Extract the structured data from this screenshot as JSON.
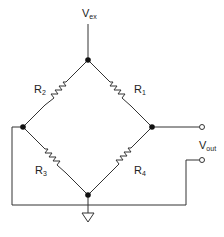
{
  "diagram": {
    "labels": {
      "vex_main": "V",
      "vex_sub": "ex",
      "vout_main": "V",
      "vout_sub": "out",
      "r1_main": "R",
      "r1_sub": "1",
      "r2_main": "R",
      "r2_sub": "2",
      "r3_main": "R",
      "r3_sub": "3",
      "r4_main": "R",
      "r4_sub": "4"
    },
    "colors": {
      "line": "#333333",
      "background": "#ffffff"
    }
  }
}
